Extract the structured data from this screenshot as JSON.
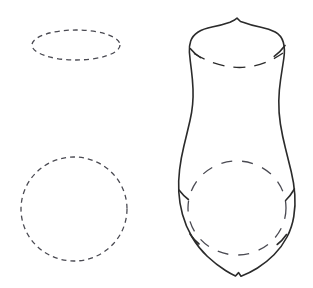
{
  "figure": {
    "kind": "technical-line-drawing",
    "canvas": {
      "width": 313,
      "height": 288
    },
    "background_color": "#ffffff",
    "ink_color": "#2b2b2b",
    "dash_color": "#4a4a52",
    "solid_stroke_width": 1.6,
    "dash_stroke_width": 1.3,
    "dash_pattern": "5 4",
    "rim_dash_pattern": "12 9",
    "body_dash_pattern": "11 10"
  },
  "shapes": {
    "construction_ellipse": {
      "label": "dashed rim ellipse",
      "center_x": 76,
      "center_y": 45,
      "radius_x": 44,
      "radius_y": 15
    },
    "construction_circle": {
      "label": "dashed body circle",
      "center_x": 74,
      "center_y": 209,
      "radius_x": 53,
      "radius_y": 52
    },
    "vessel_outline": {
      "label": "vessel profile outline",
      "path": "M 240.5 21.5 L 237.0 18.2 L 234.0 20.3 L 230.0 22.2 Q 221.0 25.3 212.0 27.0 Q 203.5 28.6 197.8 32.2 Q 192.6 35.6 190.7 41.0 Q 188.9 46.4 189.4 52.2 Q 190.2 61.0 191.4 70.0 Q 192.6 79.5 193.0 89.0 Q 193.3 97.0 192.6 104.5 Q 191.9 112.5 190.0 120.5 Q 187.0 133.5 183.8 146.5 Q 181.0 158.0 179.6 169.5 Q 178.2 181.0 178.8 192.0 Q 179.4 203.5 182.5 214.5 Q 185.8 226.5 192.0 237.0 Q 198.5 248.0 207.5 256.5 Q 216.0 264.5 225.5 270.5 Q 231.0 274.0 235.5 276.0 L 238.6 272.6 L 241.0 276.3 Q 249.5 273.0 257.5 268.0 Q 266.5 262.4 274.0 254.8 Q 281.8 247.0 287.0 237.0 Q 292.0 227.4 293.8 216.5 Q 295.6 205.6 294.8 194.5 Q 294.0 183.0 291.2 171.5 Q 288.4 160.0 285.5 148.5 Q 282.4 136.3 280.4 124.0 Q 278.6 112.5 278.8 101.0 Q 279.0 90.0 280.6 79.5 Q 282.2 69.0 283.8 58.5 Q 285.2 49.2 283.3 42.3 Q 281.4 35.4 275.2 32.0 Q 269.2 28.7 261.0 27.2 Q 252.0 25.5 243.8 22.4 Z"
    },
    "rim_arc": {
      "label": "dashed rim arc inside neck",
      "path": "M 194.0 53.5 Q 216.0 67.0 239.5 67.5 Q 263.0 67.0 283.0 53.0"
    },
    "rim_tick_left": {
      "label": "left rim junction tick",
      "path": "M 190.2 48.5 Q 195.0 54.4 200.6 57.6"
    },
    "rim_tick_right": {
      "label": "right rim junction tick",
      "path": "M 285.0 45.5 Q 280.0 52.4 274.2 56.3"
    },
    "body_circle_arc": {
      "label": "dashed body circle inside belly",
      "center_x": 237,
      "center_y": 208,
      "radius_x": 49,
      "radius_y": 47
    },
    "belly_tick_left": {
      "label": "left belly junction tick",
      "path": "M 179.0 190.0 Q 183.6 196.0 188.4 199.5"
    },
    "belly_tick_right": {
      "label": "right belly junction tick",
      "path": "M 294.4 189.0 Q 290.0 196.5 285.6 200.5"
    },
    "foot_tick_left": {
      "label": "left foot junction tick",
      "path": "M 190.0 234.0 Q 194.4 240.5 199.0 244.0"
    },
    "foot_tick_right": {
      "label": "right foot junction tick",
      "path": "M 286.5 234.5 Q 282.0 241.0 277.2 244.5"
    }
  }
}
